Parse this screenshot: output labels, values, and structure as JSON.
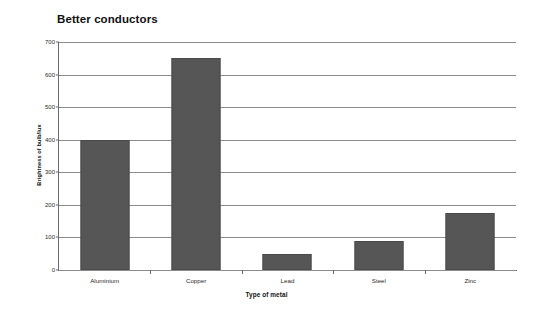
{
  "chart_data": {
    "type": "bar",
    "title": "Better conductors",
    "xlabel": "Type of metal",
    "ylabel": "Brightness of bulb/lux",
    "categories": [
      "Aluminium",
      "Copper",
      "Lead",
      "Steel",
      "Zinc"
    ],
    "values": [
      400,
      650,
      50,
      90,
      175
    ],
    "ylim": [
      0,
      700
    ],
    "ytick_labels": [
      "700",
      "600",
      "500",
      "400",
      "300",
      "200",
      "100",
      "0"
    ],
    "ytick_values": [
      700,
      600,
      500,
      400,
      300,
      200,
      100,
      0
    ],
    "ytick_step": 100,
    "grid": true,
    "legend": false,
    "bar_color": "#565656",
    "gridline_color": "#8c8c8c",
    "axis_color": "#6b6b6b",
    "background_color": "#ffffff"
  }
}
